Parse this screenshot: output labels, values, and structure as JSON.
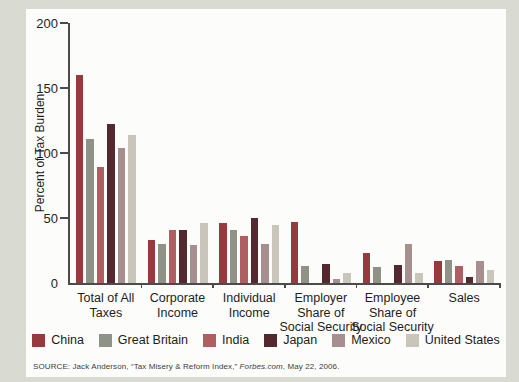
{
  "chart_data": {
    "type": "bar",
    "title": "",
    "ylabel": "Percent of Tax Burden",
    "xlabel": "",
    "ylim": [
      0,
      200
    ],
    "yticks": [
      0,
      50,
      100,
      150,
      200
    ],
    "grid": false,
    "legend_position": "bottom",
    "categories": [
      {
        "label": "Total of All Taxes",
        "lines": [
          "Total of All",
          "Taxes"
        ]
      },
      {
        "label": "Corporate Income",
        "lines": [
          "Corporate",
          "Income"
        ]
      },
      {
        "label": "Individual Income",
        "lines": [
          "Individual",
          "Income"
        ]
      },
      {
        "label": "Employer Share of Social Security",
        "lines": [
          "Employer",
          "Share of",
          "Social Security"
        ]
      },
      {
        "label": "Employee Share of Social Security",
        "lines": [
          "Employee",
          "Share of",
          "Social Security"
        ]
      },
      {
        "label": "Sales",
        "lines": [
          "Sales"
        ]
      }
    ],
    "series": [
      {
        "name": "China",
        "color": "#953b40",
        "values": [
          160,
          33,
          46,
          47,
          23,
          17
        ]
      },
      {
        "name": "Great Britain",
        "color": "#8e9287",
        "values": [
          111,
          30,
          41,
          13,
          12,
          18
        ]
      },
      {
        "name": "India",
        "color": "#af5e62",
        "values": [
          89,
          41,
          36,
          0,
          0,
          13
        ]
      },
      {
        "name": "Japan",
        "color": "#53282e",
        "values": [
          122,
          41,
          50,
          15,
          14,
          5
        ]
      },
      {
        "name": "Mexico",
        "color": "#a78f90",
        "values": [
          104,
          29,
          30,
          3,
          30,
          17
        ]
      },
      {
        "name": "United States",
        "color": "#c9c5bb",
        "values": [
          114,
          46,
          45,
          8,
          8,
          10
        ]
      }
    ]
  },
  "source": {
    "prefix": "SOURCE: Jack Anderson, “Tax Misery & Reform Index,” ",
    "italic": "Forbes.com",
    "suffix": ", May 22, 2006."
  }
}
